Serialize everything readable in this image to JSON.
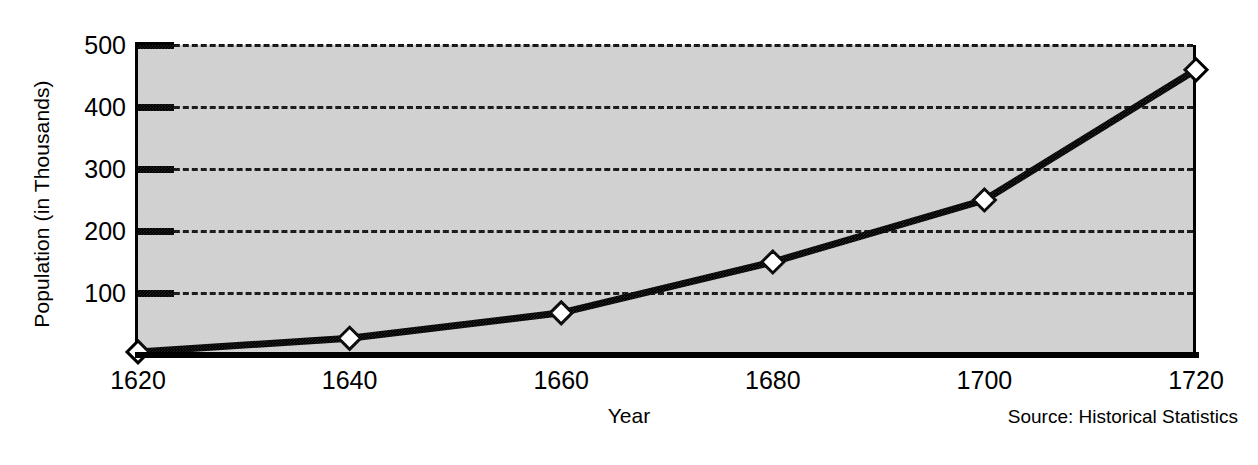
{
  "chart_data": {
    "type": "line",
    "title": "",
    "xlabel": "Year",
    "ylabel": "Population (in Thousands)",
    "x": [
      1620,
      1640,
      1660,
      1680,
      1700,
      1720
    ],
    "values": [
      5,
      27,
      68,
      150,
      250,
      460
    ],
    "series": [
      {
        "name": "Population",
        "values": [
          5,
          27,
          68,
          150,
          250,
          460
        ]
      }
    ],
    "xlim": [
      1620,
      1720
    ],
    "ylim": [
      0,
      500
    ],
    "x_tick_labels": [
      "1620",
      "1640",
      "1660",
      "1680",
      "1700",
      "1720"
    ],
    "y_tick_labels": [
      "100",
      "200",
      "300",
      "400",
      "500"
    ],
    "y_ticks": [
      100,
      200,
      300,
      400,
      500
    ],
    "grid": true,
    "grid_style": "dashed-horizontal",
    "legend": false,
    "legend_position": "none",
    "marker": "diamond",
    "annotations": [
      "Source: Historical Statistics"
    ],
    "colors": {
      "plot_background": "#cfcfcf",
      "page_background": "#ffffff",
      "line": "#000000",
      "marker_fill": "#ffffff",
      "marker_edge": "#000000",
      "grid": "#111111",
      "axis": "#000000",
      "text": "#000000"
    }
  },
  "footer": {
    "source": "Source: Historical Statistics"
  }
}
